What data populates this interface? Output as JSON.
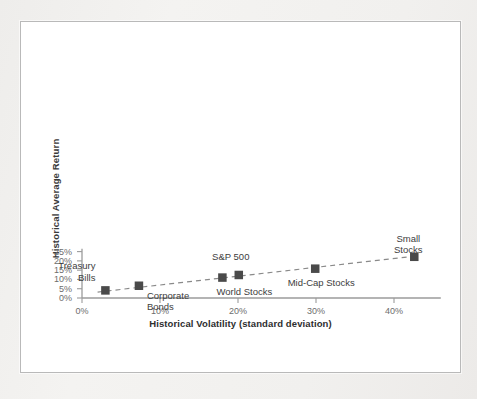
{
  "figure": {
    "background_color": "#ffffff",
    "page_color": "#f0efed",
    "border_color": "#b9b9b9",
    "marker_color": "#4a4a4a",
    "axis_color": "#9b9b9b",
    "trendline_color": "#8a8a8a",
    "tick_text_color": "#6d6d6d",
    "label_text_color": "#3d3d3d"
  },
  "chart_data": {
    "type": "scatter",
    "title": "",
    "xlabel": "Historical Volatility (standard deviation)",
    "ylabel": "Historical Average Return",
    "xlim": [
      0,
      46
    ],
    "ylim": [
      0,
      26.5
    ],
    "xticks": [
      0,
      10,
      20,
      30,
      40
    ],
    "xtick_labels": [
      "0%",
      "10%",
      "20%",
      "30%",
      "40%"
    ],
    "yticks": [
      0,
      5,
      10,
      15,
      20,
      25
    ],
    "ytick_labels": [
      "0%",
      "5%",
      "10%",
      "15%",
      "20%",
      "25%"
    ],
    "grid": false,
    "legend": "none",
    "points": [
      {
        "label": "Treasury\nBills",
        "x": 3.0,
        "y": 4.1,
        "label_anchor": "left",
        "label_dx": -10,
        "label_dy": -30
      },
      {
        "label": "Corporate\nBonds",
        "x": 7.3,
        "y": 6.6,
        "label_anchor": "right",
        "label_dx": 8,
        "label_dy": 4
      },
      {
        "label": "World Stocks",
        "x": 18.0,
        "y": 11.0,
        "label_anchor": "center",
        "label_dx": 22,
        "label_dy": 8
      },
      {
        "label": "S&P 500",
        "x": 20.1,
        "y": 12.4,
        "label_anchor": "center",
        "label_dx": -8,
        "label_dy": -24
      },
      {
        "label": "Mid-Cap Stocks",
        "x": 29.9,
        "y": 15.8,
        "label_anchor": "center",
        "label_dx": 6,
        "label_dy": 8
      },
      {
        "label": "Small Stocks",
        "x": 42.6,
        "y": 22.2,
        "label_anchor": "center",
        "label_dx": -6,
        "label_dy": -24
      }
    ],
    "trendline": {
      "style": "dashed",
      "x0": 2.0,
      "y0": 3.2,
      "x1": 43.2,
      "y1": 22.8
    },
    "annotations": []
  }
}
